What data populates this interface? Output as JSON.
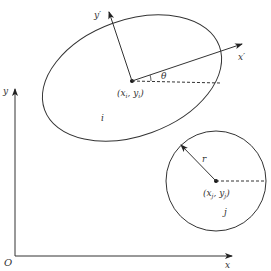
{
  "diagram": {
    "type": "geometry",
    "axes": {
      "origin_label": "O",
      "x_label": "x",
      "y_label": "y"
    },
    "ellipse": {
      "name_label": "i",
      "center_label": "(x",
      "center_sub_x": "i",
      "center_mid": ", y",
      "center_sub_y": "i",
      "center_close": ")",
      "local_x_label": "x′",
      "local_y_label": "y′",
      "angle_label": "θ"
    },
    "circle": {
      "name_label": "j",
      "center_label": "(x",
      "center_sub_x": "j",
      "center_mid": ", y",
      "center_sub_y": "j",
      "center_close": ")",
      "radius_label": "r"
    },
    "colors": {
      "stroke": "#222222",
      "background": "#ffffff"
    }
  }
}
